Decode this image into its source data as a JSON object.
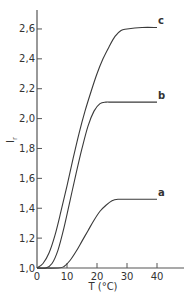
{
  "chart_data": {
    "type": "line",
    "title": "",
    "xlabel": "T (°C)",
    "ylabel": "I_r",
    "xlim": [
      0,
      48
    ],
    "ylim": [
      1.0,
      2.72
    ],
    "xticks": [
      0,
      10,
      20,
      30,
      40
    ],
    "xtick_labels": [
      "0",
      "10",
      "20",
      "30",
      "40"
    ],
    "yticks": [
      1.0,
      1.2,
      1.4,
      1.6,
      1.8,
      2.0,
      2.2,
      2.4,
      2.6
    ],
    "ytick_labels": [
      "1,0",
      "1,2",
      "1,4",
      "1,6",
      "1,8",
      "2,0",
      "2,2",
      "2,4",
      "2,6"
    ],
    "grid": false,
    "legend": "inline labels at curve ends",
    "series": [
      {
        "name": "c",
        "label": "c",
        "x": [
          0,
          2,
          4,
          6,
          8,
          10,
          12,
          14,
          16,
          18,
          20,
          22,
          24,
          26,
          28,
          30,
          35,
          40
        ],
        "y": [
          1.0,
          1.03,
          1.1,
          1.22,
          1.38,
          1.55,
          1.73,
          1.9,
          2.05,
          2.18,
          2.3,
          2.4,
          2.48,
          2.55,
          2.59,
          2.6,
          2.61,
          2.61
        ]
      },
      {
        "name": "b",
        "label": "b",
        "x": [
          0,
          3,
          5,
          7,
          9,
          11,
          13,
          15,
          17,
          19,
          21,
          23,
          25,
          30,
          35,
          40
        ],
        "y": [
          1.0,
          1.0,
          1.03,
          1.12,
          1.27,
          1.45,
          1.63,
          1.8,
          1.95,
          2.05,
          2.1,
          2.11,
          2.11,
          2.11,
          2.11,
          2.11
        ]
      },
      {
        "name": "a",
        "label": "a",
        "x": [
          0,
          7,
          9,
          11,
          13,
          15,
          17,
          19,
          21,
          23,
          25,
          27,
          30,
          35,
          40
        ],
        "y": [
          1.0,
          1.0,
          1.01,
          1.05,
          1.11,
          1.18,
          1.25,
          1.32,
          1.38,
          1.42,
          1.45,
          1.46,
          1.46,
          1.46,
          1.46
        ]
      }
    ]
  },
  "colors": {
    "line": "#3a3a3a",
    "axis": "#555555",
    "text": "#333333",
    "background": "#ffffff"
  }
}
